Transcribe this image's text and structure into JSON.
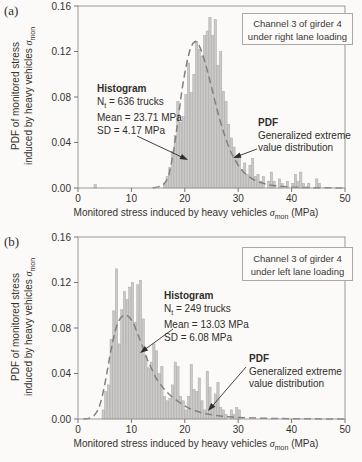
{
  "figure": {
    "colors": {
      "bar_fill": "#cbcac8",
      "bar_edge": "#a7a6a4",
      "curve": "#82817f",
      "frame": "#9a9998",
      "tick": "#777673",
      "arrow": "#2e2d2b",
      "background": "#fbfaf8"
    }
  },
  "axes": {
    "xlabel_text": "Monitored stress induced by heavy vehicles",
    "sigma": "σ",
    "sigma_sub": "mon",
    "xlabel_unit": "(MPa)",
    "ylabel_line1": "PDF of monitored stress",
    "ylabel_line2": "induced by heavy vehicles"
  },
  "chart_data": [
    {
      "type": "bar",
      "panel_label": "(a)",
      "title_box_line1": "Channel 3 of girder 4",
      "title_box_line2": "under right lane loading",
      "xlabel": "Monitored stress induced by heavy vehicles σmon (MPa)",
      "ylabel": "PDF of monitored stress induced by heavy vehicles σmon",
      "xlim": [
        0,
        50
      ],
      "ylim": [
        0,
        0.16
      ],
      "xticks": [
        0,
        10,
        20,
        30,
        40,
        50
      ],
      "yticks": [
        0,
        0.04,
        0.08,
        0.12,
        0.16
      ],
      "ytick_labels": [
        "0.00",
        "0.04",
        "0.08",
        "0.12",
        "0.16"
      ],
      "bin_width": 0.5,
      "histogram_bins": [
        [
          3.0,
          0.003
        ],
        [
          16.0,
          0.004
        ],
        [
          16.5,
          0.01
        ],
        [
          17.0,
          0.018
        ],
        [
          17.5,
          0.032
        ],
        [
          18.0,
          0.046
        ],
        [
          18.5,
          0.076
        ],
        [
          19.0,
          0.058
        ],
        [
          19.5,
          0.063
        ],
        [
          20.0,
          0.082
        ],
        [
          20.5,
          0.11
        ],
        [
          21.0,
          0.084
        ],
        [
          21.5,
          0.1
        ],
        [
          22.0,
          0.129
        ],
        [
          22.5,
          0.122
        ],
        [
          23.0,
          0.116
        ],
        [
          23.5,
          0.134
        ],
        [
          24.0,
          0.138
        ],
        [
          24.5,
          0.15
        ],
        [
          25.0,
          0.134
        ],
        [
          25.5,
          0.148
        ],
        [
          26.0,
          0.108
        ],
        [
          26.5,
          0.12
        ],
        [
          27.0,
          0.085
        ],
        [
          27.5,
          0.076
        ],
        [
          28.0,
          0.056
        ],
        [
          28.5,
          0.044
        ],
        [
          29.0,
          0.036
        ],
        [
          29.5,
          0.028
        ],
        [
          30.0,
          0.03
        ],
        [
          30.5,
          0.016
        ],
        [
          31.0,
          0.022
        ],
        [
          31.5,
          0.012
        ],
        [
          32.0,
          0.02
        ],
        [
          32.5,
          0.026
        ],
        [
          33.0,
          0.01
        ],
        [
          33.5,
          0.012
        ],
        [
          34.0,
          0.006
        ],
        [
          34.5,
          0.01
        ],
        [
          35.5,
          0.006
        ],
        [
          36.0,
          0.014
        ],
        [
          36.5,
          0.006
        ],
        [
          37.5,
          0.008
        ],
        [
          38.0,
          0.004
        ],
        [
          39.0,
          0.006
        ],
        [
          40.0,
          0.004
        ],
        [
          40.5,
          0.012
        ],
        [
          41.0,
          0.006
        ],
        [
          41.5,
          0.014
        ],
        [
          42.0,
          0.004
        ],
        [
          43.0,
          0.004
        ],
        [
          44.5,
          0.008
        ],
        [
          45.0,
          0.004
        ]
      ],
      "pdf_curve": [
        [
          14,
          0
        ],
        [
          15,
          0.001
        ],
        [
          16,
          0.003
        ],
        [
          16.5,
          0.006
        ],
        [
          17,
          0.011
        ],
        [
          17.5,
          0.022
        ],
        [
          18,
          0.035
        ],
        [
          18.5,
          0.052
        ],
        [
          19,
          0.07
        ],
        [
          19.5,
          0.087
        ],
        [
          20,
          0.101
        ],
        [
          20.5,
          0.113
        ],
        [
          21,
          0.122
        ],
        [
          21.5,
          0.127
        ],
        [
          22,
          0.129
        ],
        [
          22.5,
          0.127
        ],
        [
          23,
          0.122
        ],
        [
          23.5,
          0.115
        ],
        [
          24,
          0.107
        ],
        [
          24.5,
          0.098
        ],
        [
          25,
          0.089
        ],
        [
          25.5,
          0.079
        ],
        [
          26,
          0.07
        ],
        [
          26.5,
          0.061
        ],
        [
          27,
          0.053
        ],
        [
          27.5,
          0.046
        ],
        [
          28,
          0.039
        ],
        [
          28.5,
          0.033
        ],
        [
          29,
          0.028
        ],
        [
          29.5,
          0.024
        ],
        [
          30,
          0.02
        ],
        [
          31,
          0.014
        ],
        [
          32,
          0.01
        ],
        [
          33,
          0.007
        ],
        [
          34,
          0.005
        ],
        [
          35,
          0.0037
        ],
        [
          36,
          0.0027
        ],
        [
          37,
          0.002
        ],
        [
          38,
          0.0015
        ],
        [
          39,
          0.0011
        ],
        [
          40,
          0.0008
        ],
        [
          42,
          0.0005
        ],
        [
          44,
          0.0003
        ],
        [
          46,
          0.0002
        ],
        [
          48,
          0.0001
        ],
        [
          50,
          0.0001
        ]
      ],
      "histogram_note": {
        "title": "Histogram",
        "n_pre": "N",
        "n_sub": "t",
        "n_post": " = 636 trucks",
        "mean": "Mean = 23.71 MPa",
        "sd": "SD = 4.17 MPa"
      },
      "pdf_note": {
        "title": "PDF",
        "line2": "Generalized extreme",
        "line3": "value distribution"
      }
    },
    {
      "type": "bar",
      "panel_label": "(b)",
      "title_box_line1": "Channel 3 of girder 4",
      "title_box_line2": "under left lane loading",
      "xlabel": "Monitored stress induced by heavy vehicles σmon (MPa)",
      "ylabel": "PDF of monitored stress induced by heavy vehicles σmon",
      "xlim": [
        0,
        50
      ],
      "ylim": [
        0,
        0.16
      ],
      "xticks": [
        0,
        10,
        20,
        30,
        40,
        50
      ],
      "yticks": [
        0,
        0.04,
        0.08,
        0.12,
        0.16
      ],
      "ytick_labels": [
        "0.00",
        "0.04",
        "0.08",
        "0.12",
        "0.16"
      ],
      "bin_width": 0.5,
      "histogram_bins": [
        [
          4.5,
          0.008
        ],
        [
          5.0,
          0.024
        ],
        [
          5.5,
          0.03
        ],
        [
          6.0,
          0.07
        ],
        [
          6.5,
          0.095
        ],
        [
          7.0,
          0.132
        ],
        [
          7.5,
          0.066
        ],
        [
          8.0,
          0.096
        ],
        [
          8.5,
          0.112
        ],
        [
          9.0,
          0.105
        ],
        [
          9.5,
          0.116
        ],
        [
          10.0,
          0.12
        ],
        [
          10.5,
          0.085
        ],
        [
          11.0,
          0.118
        ],
        [
          11.5,
          0.122
        ],
        [
          12.0,
          0.088
        ],
        [
          12.5,
          0.055
        ],
        [
          13.0,
          0.045
        ],
        [
          13.5,
          0.05
        ],
        [
          14.0,
          0.066
        ],
        [
          14.5,
          0.06
        ],
        [
          15.0,
          0.04
        ],
        [
          15.5,
          0.046
        ],
        [
          16.0,
          0.02
        ],
        [
          16.5,
          0.016
        ],
        [
          17.0,
          0.018
        ],
        [
          17.5,
          0.03
        ],
        [
          18.0,
          0.05
        ],
        [
          18.5,
          0.046
        ],
        [
          19.0,
          0.02
        ],
        [
          19.5,
          0.016
        ],
        [
          20.0,
          0.008
        ],
        [
          20.5,
          0.02
        ],
        [
          21.0,
          0.048
        ],
        [
          21.5,
          0.026
        ],
        [
          22.0,
          0.024
        ],
        [
          22.5,
          0.036
        ],
        [
          23.0,
          0.016
        ],
        [
          23.5,
          0.008
        ],
        [
          24.0,
          0.042
        ],
        [
          24.5,
          0.028
        ],
        [
          25.0,
          0.012
        ],
        [
          25.5,
          0.022
        ],
        [
          26.0,
          0.032
        ],
        [
          26.5,
          0.01
        ],
        [
          27.0,
          0.008
        ],
        [
          27.5,
          0.004
        ],
        [
          28.5,
          0.008
        ],
        [
          29.0,
          0.004
        ],
        [
          29.5,
          0.01
        ],
        [
          30.0,
          0.008
        ]
      ],
      "pdf_curve": [
        [
          1,
          0
        ],
        [
          2,
          0.0005
        ],
        [
          3,
          0.003
        ],
        [
          3.5,
          0.006
        ],
        [
          4,
          0.011
        ],
        [
          4.5,
          0.019
        ],
        [
          5,
          0.03
        ],
        [
          5.5,
          0.043
        ],
        [
          6,
          0.056
        ],
        [
          6.5,
          0.068
        ],
        [
          7,
          0.078
        ],
        [
          7.5,
          0.085
        ],
        [
          8,
          0.089
        ],
        [
          8.5,
          0.091
        ],
        [
          9,
          0.0915
        ],
        [
          9.5,
          0.09
        ],
        [
          10,
          0.087
        ],
        [
          10.5,
          0.083
        ],
        [
          11,
          0.077
        ],
        [
          11.5,
          0.071
        ],
        [
          12,
          0.065
        ],
        [
          12.5,
          0.058
        ],
        [
          13,
          0.052
        ],
        [
          13.5,
          0.047
        ],
        [
          14,
          0.042
        ],
        [
          14.5,
          0.037
        ],
        [
          15,
          0.033
        ],
        [
          15.5,
          0.03
        ],
        [
          16,
          0.027
        ],
        [
          17,
          0.022
        ],
        [
          18,
          0.018
        ],
        [
          19,
          0.0145
        ],
        [
          20,
          0.0115
        ],
        [
          21,
          0.009
        ],
        [
          22,
          0.0072
        ],
        [
          23,
          0.0057
        ],
        [
          24,
          0.0046
        ],
        [
          25,
          0.0037
        ],
        [
          26,
          0.003
        ],
        [
          27,
          0.0025
        ],
        [
          28,
          0.002
        ],
        [
          29,
          0.0017
        ],
        [
          30,
          0.0014
        ],
        [
          32,
          0.001
        ],
        [
          34,
          0.0007
        ],
        [
          36,
          0.0005
        ],
        [
          38,
          0.0004
        ],
        [
          40,
          0.0003
        ],
        [
          43,
          0.0002
        ],
        [
          46,
          0.0001
        ],
        [
          50,
          0.0001
        ]
      ],
      "histogram_note": {
        "title": "Histogram",
        "n_pre": "N",
        "n_sub": "t",
        "n_post": " = 249 trucks",
        "mean": "Mean = 13.03 MPa",
        "sd": "SD = 6.08 MPa"
      },
      "pdf_note": {
        "title": "PDF",
        "line2": "Generalized extreme",
        "line3": "value distribution"
      }
    }
  ]
}
